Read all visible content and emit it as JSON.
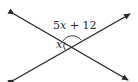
{
  "diagram": {
    "type": "intersecting-lines",
    "labels": {
      "obtuse_angle": {
        "coef": "5",
        "var": "x",
        "rest": " + 12"
      },
      "acute_angle": {
        "var": "x"
      }
    },
    "colors": {
      "line": "#2a2a2a",
      "background": "#ffffff"
    }
  }
}
